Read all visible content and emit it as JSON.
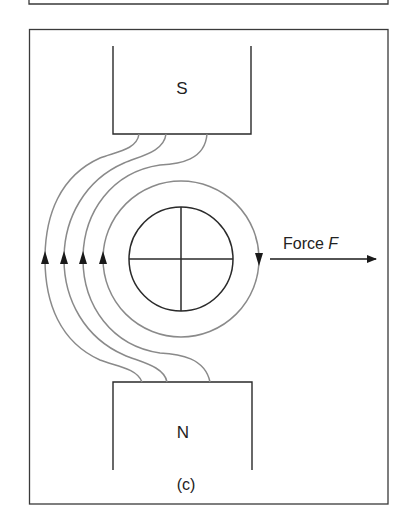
{
  "figure": {
    "south_pole_label": "S",
    "north_pole_label": "N",
    "force_label": "Force ",
    "force_symbol": "F",
    "caption": "(c)"
  },
  "colors": {
    "frame": "#3a3a3a",
    "magnet": "#2a2a2a",
    "field_line": "#8a8a8a",
    "conductor": "#2a2a2a",
    "arrow": "#1a1a1a"
  }
}
